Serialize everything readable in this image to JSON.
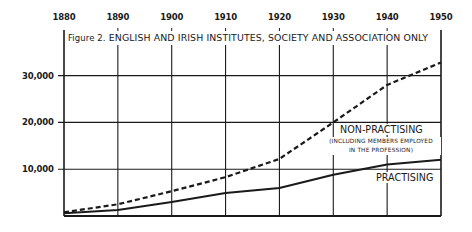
{
  "chart_data": {
    "type": "line",
    "title": "Figure 2. ENGLISH AND IRISH INSTITUTES, SOCIETY AND ASSOCIATION ONLY",
    "xlabel": "",
    "ylabel": "",
    "x": [
      1880,
      1890,
      1900,
      1910,
      1920,
      1930,
      1940,
      1950
    ],
    "x_tick_labels": [
      "1880",
      "1890",
      "1900",
      "1910",
      "1920",
      "1930",
      "1940",
      "1950"
    ],
    "y_tick_labels": [
      "10,000",
      "20,000",
      "30,000"
    ],
    "y_ticks": [
      10000,
      20000,
      30000
    ],
    "xlim": [
      1880,
      1950
    ],
    "ylim": [
      0,
      30000
    ],
    "grid": true,
    "x_axis_position": "top",
    "series": [
      {
        "name": "NON-PRACTISING",
        "sublabel": "(INCLUDING MEMBERS EMPLOYED IN THE PROFESSION)",
        "style": "dashed",
        "values": [
          800,
          2500,
          5300,
          8300,
          12200,
          20000,
          28000,
          32800
        ]
      },
      {
        "name": "PRACTISING",
        "style": "solid",
        "values": [
          600,
          1300,
          3000,
          4900,
          6000,
          8800,
          11000,
          12000
        ]
      }
    ]
  },
  "labels": {
    "title_prefix": "Figure 2.",
    "title_main": "ENGLISH AND IRISH INSTITUTES, SOCIETY AND ASSOCIATION ONLY",
    "non_practising": "NON-PRACTISING",
    "non_practising_sub1": "(INCLUDING MEMBERS EMPLOYED",
    "non_practising_sub2": "IN THE PROFESSION)",
    "practising": "PRACTISING"
  },
  "colors": {
    "ink": "#1a1a1a",
    "background": "#ffffff"
  }
}
